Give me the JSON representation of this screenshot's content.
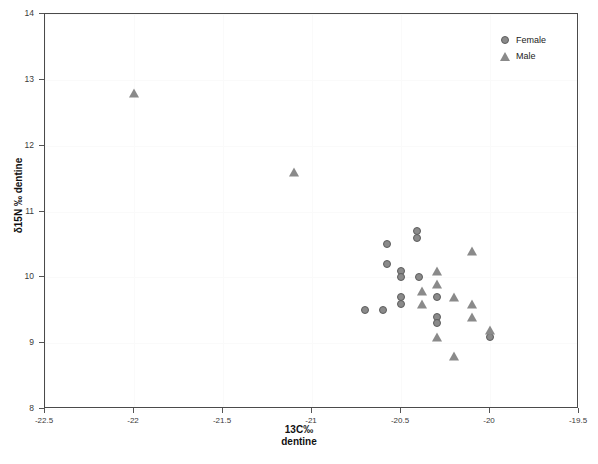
{
  "chart_data": {
    "type": "scatter",
    "title": "",
    "xlabel": "13C‰",
    "xlabel_line2": "dentine",
    "ylabel": "δ15N ‰ dentine",
    "xlim": [
      -22.5,
      -19.5
    ],
    "ylim": [
      8,
      14
    ],
    "xticks": [
      "-22.5",
      "-22",
      "-21.5",
      "-21",
      "-20.5",
      "-20",
      "-19.5"
    ],
    "xtick_values": [
      -22.5,
      -22,
      -21.5,
      -21,
      -20.5,
      -20,
      -19.5
    ],
    "yticks": [
      "8",
      "9",
      "10",
      "11",
      "12",
      "13",
      "14"
    ],
    "ytick_values": [
      8,
      9,
      10,
      11,
      12,
      13,
      14
    ],
    "grid": true,
    "legend_position": "top-right",
    "series": [
      {
        "name": "Female",
        "marker": "circle",
        "color": "#8a8a8a",
        "points": [
          [
            -20.7,
            9.5
          ],
          [
            -20.6,
            9.5
          ],
          [
            -20.58,
            10.5
          ],
          [
            -20.58,
            10.2
          ],
          [
            -20.5,
            10.1
          ],
          [
            -20.5,
            10.0
          ],
          [
            -20.5,
            9.7
          ],
          [
            -20.5,
            9.6
          ],
          [
            -20.41,
            10.7
          ],
          [
            -20.41,
            10.6
          ],
          [
            -20.4,
            10.0
          ],
          [
            -20.3,
            9.7
          ],
          [
            -20.3,
            9.4
          ],
          [
            -20.3,
            9.3
          ],
          [
            -20.0,
            9.1
          ]
        ]
      },
      {
        "name": "Male",
        "marker": "triangle",
        "color": "#8a8a8a",
        "points": [
          [
            -22.0,
            12.8
          ],
          [
            -21.1,
            11.6
          ],
          [
            -20.38,
            9.8
          ],
          [
            -20.38,
            9.6
          ],
          [
            -20.3,
            10.1
          ],
          [
            -20.3,
            9.9
          ],
          [
            -20.3,
            9.1
          ],
          [
            -20.2,
            9.7
          ],
          [
            -20.2,
            8.8
          ],
          [
            -20.1,
            10.4
          ],
          [
            -20.1,
            9.6
          ],
          [
            -20.1,
            9.4
          ],
          [
            -20.0,
            9.2
          ]
        ]
      }
    ]
  },
  "legend": {
    "items": [
      {
        "label": "Female",
        "marker": "circle"
      },
      {
        "label": "Male",
        "marker": "triangle"
      }
    ]
  }
}
